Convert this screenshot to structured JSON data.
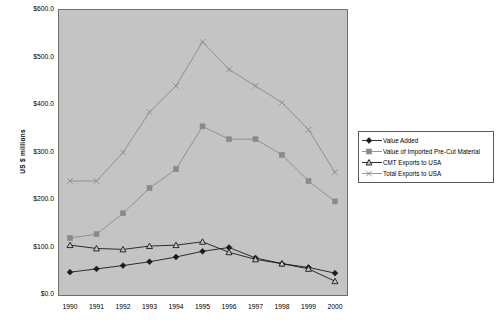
{
  "chart_data": {
    "type": "line",
    "title": "",
    "xlabel": "",
    "ylabel": "US $ millions",
    "x": [
      1990,
      1991,
      1992,
      1993,
      1994,
      1995,
      1996,
      1997,
      1998,
      1999,
      2000
    ],
    "categories": [
      "1990",
      "1991",
      "1992",
      "1993",
      "1994",
      "1995",
      "1996",
      "1997",
      "1998",
      "1999",
      "2000"
    ],
    "ylim": [
      0,
      600
    ],
    "yticks": [
      0,
      100,
      200,
      300,
      400,
      500,
      600
    ],
    "ytick_labels": [
      "$0.0",
      "$100.0",
      "$200.0",
      "$300.0",
      "$400.0",
      "$500.0",
      "$600.0"
    ],
    "grid": false,
    "legend_position": "right",
    "series": [
      {
        "name": "Value Added",
        "marker": "diamond",
        "color": "#1b1b1b",
        "values": [
          48,
          55,
          62,
          70,
          80,
          92,
          100,
          78,
          66,
          58,
          46
        ]
      },
      {
        "name": "Value of Imported Pre-Cut Material",
        "marker": "square",
        "color": "#8a8a8a",
        "values": [
          120,
          128,
          172,
          225,
          265,
          355,
          328,
          328,
          295,
          240,
          197
        ]
      },
      {
        "name": "CMT Exports to USA",
        "marker": "triangle-open",
        "color": "#1b1b1b",
        "values": [
          105,
          98,
          96,
          103,
          105,
          112,
          90,
          75,
          66,
          55,
          29
        ]
      },
      {
        "name": "Total Exports to USA",
        "marker": "cross",
        "color": "#8a8a8a",
        "values": [
          240,
          240,
          300,
          385,
          440,
          533,
          475,
          440,
          405,
          348,
          258
        ]
      }
    ]
  },
  "legend": {
    "items": [
      {
        "label": "Value Added"
      },
      {
        "label": "Value of Imported Pre-Cut Material"
      },
      {
        "label": "CMT Exports to USA"
      },
      {
        "label": "Total Exports to USA"
      }
    ]
  }
}
